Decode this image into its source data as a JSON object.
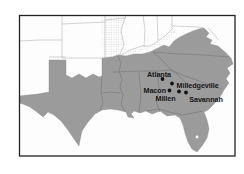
{
  "map": {
    "description_of_view": "Map of the southern United States with shaded Confederate states and Georgia march cities marked",
    "cities": [
      {
        "name": "Atlanta",
        "dot": {
          "x": 162.5,
          "y": 79
        },
        "label": {
          "x": 159,
          "y": 77,
          "anchor": "middle"
        }
      },
      {
        "name": "Milledgeville",
        "dot": {
          "x": 172,
          "y": 83.5
        },
        "label": {
          "x": 176.5,
          "y": 87.5,
          "anchor": "start"
        }
      },
      {
        "name": "Macon",
        "dot": {
          "x": 169.5,
          "y": 90.5
        },
        "label": {
          "x": 166,
          "y": 93,
          "anchor": "end"
        }
      },
      {
        "name": "Millen",
        "dot": {
          "x": 179,
          "y": 91.5
        },
        "label": {
          "x": 165.5,
          "y": 100.5,
          "anchor": "middle"
        }
      },
      {
        "name": "Savannah",
        "dot": {
          "x": 186,
          "y": 92.5
        },
        "label": {
          "x": 206,
          "y": 101.5,
          "anchor": "middle"
        }
      }
    ],
    "colors": {
      "shaded_region": "#9b9b9b",
      "union_region": "#fdfdfd",
      "border_light": "#b5b5b5",
      "border_dark": "#6f6f6f",
      "frame": "#222222",
      "dot": "#151515",
      "label": "#151515",
      "lake": "#ffffff",
      "background": "#ffffff"
    }
  }
}
